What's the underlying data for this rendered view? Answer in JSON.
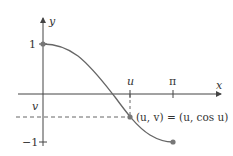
{
  "diagram": {
    "type": "function-graph",
    "function": "y = cos x",
    "domain": [
      0,
      3.14159
    ],
    "axes": {
      "x_label": "x",
      "y_label": "y"
    },
    "ticks": {
      "x": [
        {
          "label": "u"
        },
        {
          "label": "π"
        }
      ],
      "y": [
        {
          "label": "1"
        },
        {
          "label": "v"
        },
        {
          "label": "−1"
        }
      ]
    },
    "points": [
      {
        "name": "start",
        "coords": "(0, 1)"
      },
      {
        "name": "marked-point",
        "label": "(u, v) = (u, cos u)"
      },
      {
        "name": "end",
        "coords": "(π, −1)"
      }
    ],
    "colors": {
      "curve": "#666666",
      "axes": "#444444",
      "points": "#777777",
      "dashed": "#555555"
    }
  }
}
